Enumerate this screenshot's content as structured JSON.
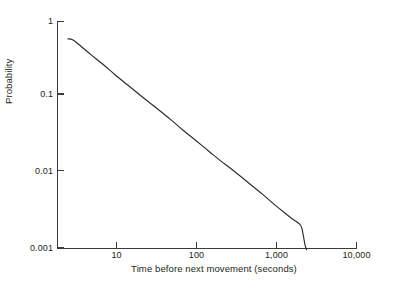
{
  "figure": {
    "background_color": "#ffffff",
    "axis_color": "#3b3b3b",
    "curve_color": "#2b2b2b"
  },
  "chart_data": {
    "type": "line",
    "title": "",
    "xlabel": "Time before next movement (seconds)",
    "ylabel": "Probability",
    "xscale": "log",
    "yscale": "log",
    "xlim": [
      1.9,
      10000
    ],
    "ylim": [
      0.001,
      1
    ],
    "grid": false,
    "legend": null,
    "xticks": [
      10,
      100,
      1000,
      10000
    ],
    "xtick_labels": [
      "10",
      "100",
      "1,000",
      "10,000"
    ],
    "yticks": [
      0.001,
      0.01,
      0.1,
      1
    ],
    "ytick_labels": [
      "0.001",
      "0.01",
      "0.1",
      "1"
    ],
    "series": [
      {
        "name": "Probability of time before next movement",
        "x": [
          2.6,
          3,
          4,
          5,
          7,
          10,
          15,
          20,
          30,
          50,
          70,
          100,
          150,
          200,
          300,
          500,
          700,
          1000,
          1300,
          1600,
          1800,
          2000,
          2100,
          2200,
          2300,
          2400
        ],
        "y": [
          0.58,
          0.56,
          0.44,
          0.36,
          0.27,
          0.195,
          0.137,
          0.107,
          0.076,
          0.049,
          0.036,
          0.0265,
          0.0186,
          0.0145,
          0.0104,
          0.0067,
          0.005,
          0.0036,
          0.00288,
          0.00242,
          0.00222,
          0.00203,
          0.0018,
          0.0014,
          0.00108,
          0.00095
        ]
      }
    ]
  }
}
